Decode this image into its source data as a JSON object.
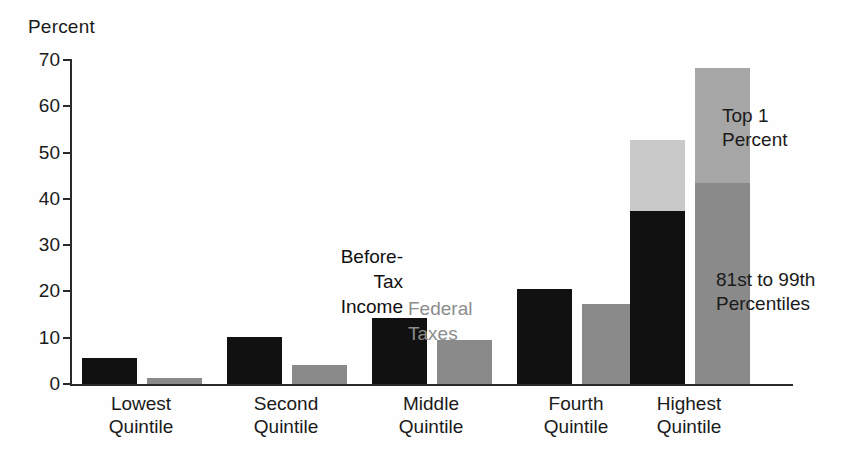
{
  "axis": {
    "y_title": "Percent",
    "ticks": [
      {
        "value": 70,
        "label": "70"
      },
      {
        "value": 60,
        "label": "60"
      },
      {
        "value": 50,
        "label": "50"
      },
      {
        "value": 40,
        "label": "40"
      },
      {
        "value": 30,
        "label": "30"
      },
      {
        "value": 20,
        "label": "20"
      },
      {
        "value": 10,
        "label": "10"
      },
      {
        "value": 0,
        "label": "0"
      }
    ]
  },
  "legend": {
    "before_tax_income": [
      "Before-",
      "Tax",
      "Income"
    ],
    "federal_taxes": [
      "Federal",
      "Taxes"
    ]
  },
  "annotations": {
    "top_1_percent": [
      "Top 1",
      "Percent"
    ],
    "p81_to_99": [
      "81st to 99th",
      "Percentiles"
    ]
  },
  "categories": [
    {
      "line1": "Lowest",
      "line2": "Quintile"
    },
    {
      "line1": "Second",
      "line2": "Quintile"
    },
    {
      "line1": "Middle",
      "line2": "Quintile"
    },
    {
      "line1": "Fourth",
      "line2": "Quintile"
    },
    {
      "line1": "Highest",
      "line2": "Quintile"
    }
  ],
  "colors": {
    "before_tax_income": "#111111",
    "federal_taxes": "#8a8a8a",
    "top_1_percent_income": "#c9c9c9",
    "top_1_percent_taxes": "#a6a6a6",
    "axis": "#2a2a2a",
    "background": "#fefefe"
  },
  "chart_data": {
    "type": "bar",
    "title": "",
    "subtitle": "",
    "xlabel": "",
    "ylabel": "Percent",
    "ylim": [
      0,
      70
    ],
    "ytick_step": 10,
    "grid": false,
    "legend_position": "inline-over-middle-quintile",
    "categories": [
      "Lowest Quintile",
      "Second Quintile",
      "Middle Quintile",
      "Fourth Quintile",
      "Highest Quintile"
    ],
    "series": [
      {
        "name": "Before-Tax Income",
        "color": "#111111",
        "values": [
          5.6,
          10.1,
          14.3,
          20.5,
          52.7
        ],
        "stacked_top": {
          "name": "Top 1 Percent",
          "color": "#c9c9c9",
          "values": [
            0,
            0,
            0,
            0,
            15.3
          ],
          "base_values": [
            5.6,
            10.1,
            14.3,
            20.5,
            37.4
          ]
        }
      },
      {
        "name": "Federal Taxes",
        "color": "#8a8a8a",
        "values": [
          1.3,
          4.1,
          9.5,
          17.3,
          68.3
        ],
        "stacked_top": {
          "name": "Top 1 Percent",
          "color": "#a6a6a6",
          "values": [
            0,
            0,
            0,
            0,
            24.9
          ],
          "base_values": [
            1.3,
            4.1,
            9.5,
            17.3,
            43.4
          ]
        }
      }
    ],
    "notes": [
      "Highest Quintile bars are stacked: lower segment = 81st to 99th Percentiles, upper segment = Top 1 Percent."
    ]
  }
}
